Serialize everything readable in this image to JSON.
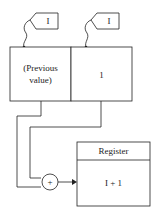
{
  "diagram": {
    "tags": [
      {
        "label": "I"
      },
      {
        "label": "I"
      }
    ],
    "memory_cells": [
      {
        "text_line1": "(Previous",
        "text_line2": "value)"
      },
      {
        "text": "1"
      }
    ],
    "adder": {
      "symbol": "+"
    },
    "register": {
      "title": "Register",
      "value": "I + 1"
    }
  }
}
